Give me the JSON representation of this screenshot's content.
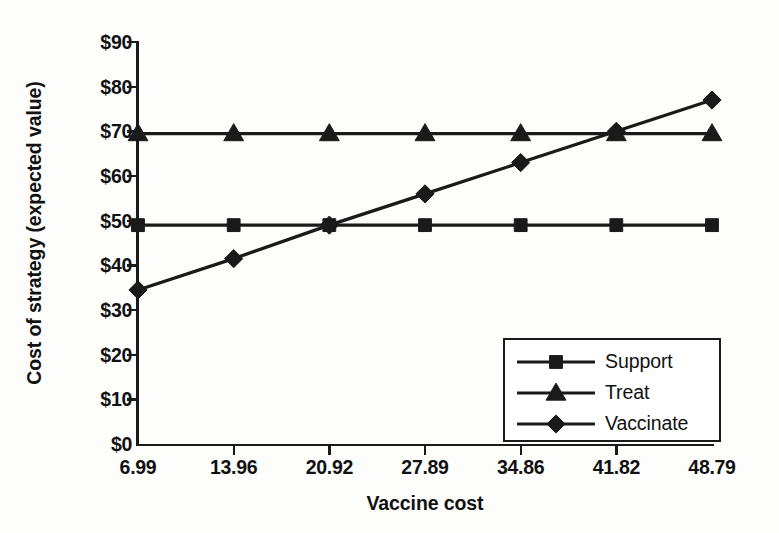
{
  "chart_data": {
    "type": "line",
    "title": "",
    "xlabel": "Vaccine cost",
    "ylabel": "Cost of strategy (expected value)",
    "categories": [
      "6.99",
      "13.96",
      "20.92",
      "27.89",
      "34.86",
      "41.82",
      "48.79"
    ],
    "x_tick_labels": [
      "6.99",
      "13.96",
      "20.92",
      "27.89",
      "34.86",
      "41.82",
      "48.79"
    ],
    "y_tick_labels": [
      "$0",
      "$10",
      "$20",
      "$30",
      "$40",
      "$50",
      "$60",
      "$70",
      "$80",
      "$90"
    ],
    "y_tick_values": [
      0,
      10,
      20,
      30,
      40,
      50,
      60,
      70,
      80,
      90
    ],
    "ylim": [
      0,
      90
    ],
    "grid": false,
    "legend_position": "bottom-right",
    "series": [
      {
        "name": "Support",
        "marker": "square",
        "color": "#1a1a1a",
        "values": [
          49,
          49,
          49,
          49,
          49,
          49,
          49
        ]
      },
      {
        "name": "Treat",
        "marker": "triangle",
        "color": "#1a1a1a",
        "values": [
          69.5,
          69.5,
          69.5,
          69.5,
          69.5,
          69.5,
          69.5
        ]
      },
      {
        "name": "Vaccinate",
        "marker": "diamond",
        "color": "#1a1a1a",
        "values": [
          34.5,
          41.5,
          49,
          56,
          63,
          70,
          77
        ]
      }
    ],
    "legend": [
      {
        "label": "Support",
        "marker": "square"
      },
      {
        "label": "Treat",
        "marker": "triangle"
      },
      {
        "label": "Vaccinate",
        "marker": "diamond"
      }
    ],
    "annotations": []
  }
}
